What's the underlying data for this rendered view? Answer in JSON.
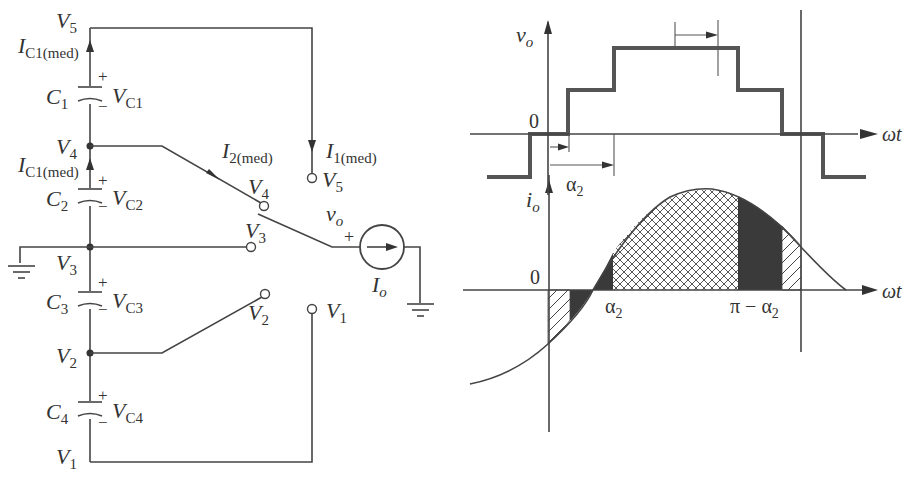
{
  "circuit": {
    "nodes": {
      "v5": {
        "label": "V",
        "sub": "5"
      },
      "v4": {
        "label": "V",
        "sub": "4"
      },
      "v3": {
        "label": "V",
        "sub": "3"
      },
      "v2": {
        "label": "V",
        "sub": "2"
      },
      "v1": {
        "label": "V",
        "sub": "1"
      }
    },
    "capacitors": [
      {
        "name": "C",
        "sub": "1",
        "voltage": "V",
        "vsub": "C1",
        "plus": "+",
        "minus": "−"
      },
      {
        "name": "C",
        "sub": "2",
        "voltage": "V",
        "vsub": "C2",
        "plus": "+",
        "minus": "−"
      },
      {
        "name": "C",
        "sub": "3",
        "voltage": "V",
        "vsub": "C3",
        "plus": "+",
        "minus": "−"
      },
      {
        "name": "C",
        "sub": "4",
        "voltage": "V",
        "vsub": "C4",
        "plus": "+",
        "minus": "−"
      }
    ],
    "currents": {
      "ic1_top": {
        "label": "I",
        "sub": "C1(med)"
      },
      "ic1_mid": {
        "label": "I",
        "sub": "C1(med)"
      },
      "i2": {
        "label": "I",
        "sub": "2(med)"
      },
      "i1": {
        "label": "I",
        "sub": "1(med)"
      }
    },
    "switch_terminals": {
      "t5": {
        "label": "V",
        "sub": "5"
      },
      "t4": {
        "label": "V",
        "sub": "4"
      },
      "t3": {
        "label": "V",
        "sub": "3"
      },
      "t2": {
        "label": "V",
        "sub": "2"
      },
      "t1": {
        "label": "V",
        "sub": "1"
      }
    },
    "output": {
      "vo_label": "v",
      "vo_sub": "o",
      "plus": "+"
    },
    "source": {
      "label": "I",
      "sub": "o"
    }
  },
  "waveforms": {
    "vo_axis": {
      "label": "v",
      "sub": "o",
      "zero": "0",
      "x_label": "ωt"
    },
    "io_axis": {
      "label": "i",
      "sub": "o",
      "zero": "0",
      "x_label": "ωt"
    },
    "annotations": {
      "alpha2": {
        "label": "α",
        "sub": "2"
      },
      "alpha2_io": {
        "label": "α",
        "sub": "2"
      },
      "pi_minus_alpha2": {
        "label": "π − α",
        "sub": "2"
      }
    }
  },
  "colors": {
    "line": "#444444",
    "fill_dark": "#3a3a3a",
    "background": "#ffffff"
  }
}
